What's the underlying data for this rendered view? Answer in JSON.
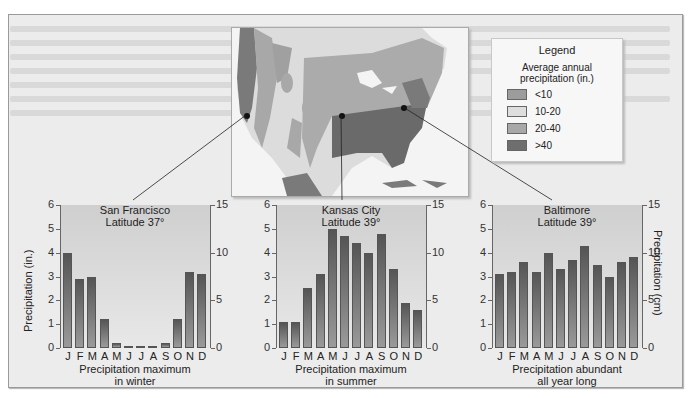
{
  "legend": {
    "title": "Legend",
    "subtitle_line1": "Average annual",
    "subtitle_line2": "precipitation (in.)",
    "items": [
      {
        "label": "<10",
        "color": "#9c9c9c"
      },
      {
        "label": "10-20",
        "color": "#dedede"
      },
      {
        "label": "20-40",
        "color": "#a8a8a8"
      },
      {
        "label": ">40",
        "color": "#6e6e6e"
      }
    ]
  },
  "axes": {
    "left_label": "Precipitation (in.)",
    "right_label": "Precipitation (cm)",
    "left_ticks": [
      "0",
      "1",
      "2",
      "3",
      "4",
      "5",
      "6"
    ],
    "right_ticks": [
      "0",
      "5",
      "10",
      "15"
    ]
  },
  "months": [
    "J",
    "F",
    "M",
    "A",
    "M",
    "J",
    "J",
    "A",
    "S",
    "O",
    "N",
    "D"
  ],
  "charts": [
    {
      "city": "San Francisco",
      "latitude": "Latitude 37°",
      "caption_line1": "Precipitation maximum",
      "caption_line2": "in winter"
    },
    {
      "city": "Kansas City",
      "latitude": "Latitude 39°",
      "caption_line1": "Precipitation maximum",
      "caption_line2": "in summer"
    },
    {
      "city": "Baltimore",
      "latitude": "Latitude 39°",
      "caption_line1": "Precipitation abundant",
      "caption_line2": "all year long"
    }
  ],
  "chart_data": [
    {
      "type": "bar",
      "title": "San Francisco Latitude 37°",
      "categories": [
        "J",
        "F",
        "M",
        "A",
        "M",
        "J",
        "J",
        "A",
        "S",
        "O",
        "N",
        "D"
      ],
      "values": [
        4.0,
        2.9,
        3.0,
        1.2,
        0.2,
        0.1,
        0.02,
        0.05,
        0.2,
        1.2,
        3.2,
        3.1
      ],
      "xlabel": "Precipitation maximum in winter",
      "ylabel": "Precipitation (in.)",
      "ylabel_right": "Precipitation (cm)",
      "ylim": [
        0,
        6
      ],
      "ylim_right": [
        0,
        15
      ]
    },
    {
      "type": "bar",
      "title": "Kansas City Latitude 39°",
      "categories": [
        "J",
        "F",
        "M",
        "A",
        "M",
        "J",
        "J",
        "A",
        "S",
        "O",
        "N",
        "D"
      ],
      "values": [
        1.1,
        1.1,
        2.5,
        3.1,
        5.0,
        4.7,
        4.4,
        4.0,
        4.8,
        3.3,
        1.9,
        1.6
      ],
      "xlabel": "Precipitation maximum in summer",
      "ylabel": "Precipitation (in.)",
      "ylabel_right": "Precipitation (cm)",
      "ylim": [
        0,
        6
      ],
      "ylim_right": [
        0,
        15
      ]
    },
    {
      "type": "bar",
      "title": "Baltimore Latitude 39°",
      "categories": [
        "J",
        "F",
        "M",
        "A",
        "M",
        "J",
        "J",
        "A",
        "S",
        "O",
        "N",
        "D"
      ],
      "values": [
        3.1,
        3.2,
        3.6,
        3.2,
        4.0,
        3.3,
        3.7,
        4.3,
        3.5,
        3.0,
        3.6,
        3.8
      ],
      "xlabel": "Precipitation abundant all year long",
      "ylabel": "Precipitation (in.)",
      "ylabel_right": "Precipitation (cm)",
      "ylim": [
        0,
        6
      ],
      "ylim_right": [
        0,
        15
      ]
    }
  ]
}
